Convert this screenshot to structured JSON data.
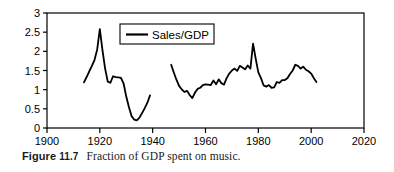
{
  "caption": {
    "figure_word": "Figure",
    "figure_number": "11.7",
    "text": "Fraction of GDP spent on music."
  },
  "legend": {
    "entries": [
      {
        "label": "Sales/GDP",
        "color": "#000000"
      }
    ],
    "position": "top-center-left"
  },
  "chart_data": {
    "type": "line",
    "title": "",
    "xlabel": "",
    "ylabel": "",
    "xlim": [
      1900,
      2020
    ],
    "ylim": [
      0,
      3
    ],
    "xticks": [
      1900,
      1920,
      1940,
      1960,
      1980,
      2000,
      2020
    ],
    "xtick_labels": [
      "1900",
      "1920",
      "1940",
      "1960",
      "1980",
      "2000",
      "2020"
    ],
    "yticks": [
      0,
      0.5,
      1,
      1.5,
      2,
      2.5,
      3
    ],
    "ytick_labels": [
      "0",
      "0.5",
      "1",
      "1.5",
      "2",
      "2.5",
      "3"
    ],
    "grid": false,
    "line_color": "#000000",
    "line_width": 1.8,
    "series": [
      {
        "name": "Sales/GDP",
        "color": "#000000",
        "segments": [
          {
            "name": "1914-1939",
            "x": [
              1914,
              1915,
              1916,
              1917,
              1918,
              1919,
              1920,
              1921,
              1922,
              1923,
              1924,
              1925,
              1926,
              1927,
              1928,
              1929,
              1930,
              1931,
              1932,
              1933,
              1934,
              1935,
              1936,
              1937,
              1938,
              1939
            ],
            "y": [
              1.19,
              1.33,
              1.48,
              1.62,
              1.78,
              2.05,
              2.58,
              2.03,
              1.55,
              1.21,
              1.18,
              1.35,
              1.33,
              1.32,
              1.31,
              1.16,
              0.82,
              0.55,
              0.31,
              0.22,
              0.2,
              0.27,
              0.39,
              0.52,
              0.66,
              0.85
            ]
          },
          {
            "name": "1947-2002",
            "x": [
              1947,
              1948,
              1949,
              1950,
              1951,
              1952,
              1953,
              1954,
              1955,
              1956,
              1957,
              1958,
              1959,
              1960,
              1961,
              1962,
              1963,
              1964,
              1965,
              1966,
              1967,
              1968,
              1969,
              1970,
              1971,
              1972,
              1973,
              1974,
              1975,
              1976,
              1977,
              1978,
              1979,
              1980,
              1981,
              1982,
              1983,
              1984,
              1985,
              1986,
              1987,
              1988,
              1989,
              1990,
              1991,
              1992,
              1993,
              1994,
              1995,
              1996,
              1997,
              1998,
              1999,
              2000,
              2001,
              2002
            ],
            "y": [
              1.65,
              1.45,
              1.26,
              1.1,
              1.01,
              0.94,
              0.97,
              0.86,
              0.78,
              0.92,
              1.02,
              1.05,
              1.12,
              1.14,
              1.13,
              1.12,
              1.24,
              1.14,
              1.27,
              1.17,
              1.13,
              1.3,
              1.42,
              1.5,
              1.55,
              1.49,
              1.62,
              1.58,
              1.53,
              1.63,
              1.55,
              2.2,
              1.81,
              1.45,
              1.3,
              1.11,
              1.08,
              1.12,
              1.05,
              1.06,
              1.2,
              1.18,
              1.25,
              1.25,
              1.3,
              1.41,
              1.5,
              1.65,
              1.62,
              1.55,
              1.6,
              1.52,
              1.48,
              1.42,
              1.3,
              1.2
            ]
          }
        ]
      }
    ]
  }
}
